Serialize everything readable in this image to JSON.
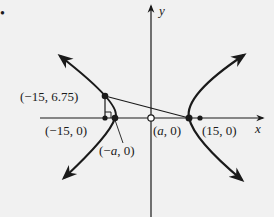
{
  "diagram": {
    "type": "hyperbola",
    "bullet": "•",
    "axes": {
      "x_label": "x",
      "y_label": "y"
    },
    "points": [
      {
        "id": "p1",
        "label": "(−15, 6.75)",
        "style": "filled"
      },
      {
        "id": "p2",
        "label": "(−15, 0)",
        "style": "filled"
      },
      {
        "id": "p3",
        "label": "(−a, 0)",
        "style": "filled"
      },
      {
        "id": "p4",
        "label": "(a, 0)",
        "style": "open"
      },
      {
        "id": "p5",
        "label": "(15, 0)",
        "style": "filled"
      }
    ],
    "labels": {
      "p1": "(−15, 6.75)",
      "p2": "(−15, 0)",
      "p3_pre": "(−",
      "p3_var": "a",
      "p3_post": ", 0)",
      "p4_pre": "(",
      "p4_var": "a",
      "p4_post": ", 0)",
      "p5": "(15, 0)"
    },
    "colors": {
      "background": "#f1f1f1",
      "ink": "#1a1a1a"
    }
  }
}
